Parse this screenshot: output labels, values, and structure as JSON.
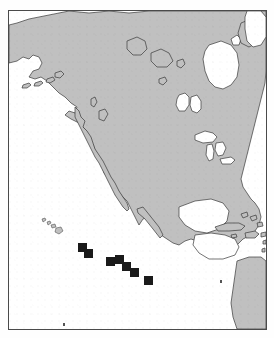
{
  "figure": {
    "kind": "reference-map",
    "caption": "",
    "width": 274,
    "height": 338,
    "frame": {
      "x": 8,
      "y": 10,
      "width": 259,
      "height": 320,
      "border_color": "#4a4a4a"
    }
  },
  "style": {
    "land_fill": "#c0c0c0",
    "land_stroke": "#3a3a3a",
    "ocean_fill": "#ffffff",
    "marker_fill": "#1a1a1a",
    "page_background": "#ffffff"
  },
  "legend": {
    "marker_shape": "filled-square",
    "marker_label": "",
    "marker_count": 7
  },
  "map_data": {
    "type": "point-locality-map",
    "projection_hint": "equirectangular",
    "region_label": "North America and eastern Pacific Ocean",
    "landmasses": [
      {
        "name": "alaska-siberia-mainland",
        "label": "Alaska / Northwest North America"
      },
      {
        "name": "canada-mainland",
        "label": "Canada"
      },
      {
        "name": "greenland",
        "label": "Greenland"
      },
      {
        "name": "baffin-island",
        "label": "Baffin Island"
      },
      {
        "name": "victoria-island",
        "label": "Victoria Island"
      },
      {
        "name": "banks-island",
        "label": "Banks Island"
      },
      {
        "name": "ellesmere-island",
        "label": "Ellesmere Island"
      },
      {
        "name": "newfoundland",
        "label": "Newfoundland"
      },
      {
        "name": "united-states-mainland",
        "label": "United States"
      },
      {
        "name": "great-lakes",
        "label": "Great Lakes"
      },
      {
        "name": "hudson-bay",
        "label": "Hudson Bay"
      },
      {
        "name": "great-slave-lake",
        "label": "Great Slave Lake"
      },
      {
        "name": "great-bear-lake",
        "label": "Great Bear Lake"
      },
      {
        "name": "mexico",
        "label": "Mexico"
      },
      {
        "name": "baja-california",
        "label": "Baja California"
      },
      {
        "name": "central-america",
        "label": "Central America"
      },
      {
        "name": "cuba",
        "label": "Cuba"
      },
      {
        "name": "hispaniola",
        "label": "Hispaniola"
      },
      {
        "name": "bahamas",
        "label": "Bahamas"
      },
      {
        "name": "jamaica",
        "label": "Jamaica"
      },
      {
        "name": "puerto-rico",
        "label": "Puerto Rico"
      },
      {
        "name": "lesser-antilles",
        "label": "Lesser Antilles"
      },
      {
        "name": "south-america",
        "label": "South America"
      },
      {
        "name": "hawaiian-islands",
        "label": "Hawaiian Islands"
      }
    ],
    "markers": [
      {
        "id": 1,
        "x": 82,
        "y": 247,
        "size": 9
      },
      {
        "id": 2,
        "x": 88,
        "y": 253,
        "size": 9
      },
      {
        "id": 3,
        "x": 110,
        "y": 261,
        "size": 9
      },
      {
        "id": 4,
        "x": 119,
        "y": 259,
        "size": 9
      },
      {
        "id": 5,
        "x": 126,
        "y": 266,
        "size": 9
      },
      {
        "id": 6,
        "x": 134,
        "y": 272,
        "size": 9
      },
      {
        "id": 7,
        "x": 148,
        "y": 280,
        "size": 9
      }
    ],
    "small_dots": [
      {
        "id": "dot-pacific-east",
        "x": 219,
        "y": 279,
        "size": 2
      },
      {
        "id": "dot-lower-left",
        "x": 62,
        "y": 322,
        "size": 2
      }
    ]
  }
}
